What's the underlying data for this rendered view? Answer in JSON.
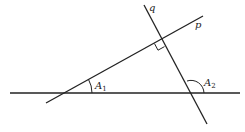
{
  "diagram": {
    "type": "geometry",
    "stroke_color": "#222222",
    "lines": {
      "horizontal": {
        "x1": 10,
        "y1": 93,
        "x2": 240,
        "y2": 93
      },
      "p": {
        "name": "p",
        "x1": 46,
        "y1": 103,
        "x2": 203,
        "y2": 16
      },
      "q": {
        "name": "q",
        "x1": 144,
        "y1": 5,
        "x2": 207,
        "y2": 124
      }
    },
    "labels": {
      "q": "q",
      "p": "p",
      "angle1_letter": "A",
      "angle1_sub": "1",
      "angle2_letter": "A",
      "angle2_sub": "2"
    },
    "right_angle_marker": true
  }
}
